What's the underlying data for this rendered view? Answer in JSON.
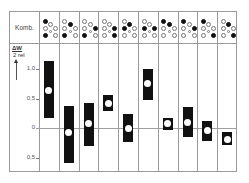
{
  "chart_data": {
    "type": "bar",
    "subtype": "floating-range-with-mean",
    "header_label": "Komb.",
    "ylabel": "ΔW/2 rel",
    "ylabel_parts": {
      "main": "ΔW",
      "sub": "2 rel"
    },
    "yticks": [
      {
        "value": 1.0,
        "label": "1,0"
      },
      {
        "value": 0.5,
        "label": "0,5"
      },
      {
        "value": 0,
        "label": "0"
      },
      {
        "value": -0.5,
        "label": "0,5"
      }
    ],
    "ylim": [
      -0.75,
      1.2
    ],
    "grid": false,
    "legend": null,
    "categories": [
      "K1",
      "K2",
      "K3",
      "K4",
      "K5",
      "K6",
      "K7",
      "K8",
      "K9",
      "K10"
    ],
    "combination_dot_positions": [
      "left-top",
      "left-mid",
      "left-bottom",
      "center-upper",
      "center-lower",
      "right-mid",
      "right-bottom"
    ],
    "combinations": [
      [
        1,
        0,
        1,
        0,
        0,
        0,
        0
      ],
      [
        0,
        0,
        1,
        1,
        0,
        0,
        0
      ],
      [
        0,
        0,
        1,
        0,
        0,
        1,
        0
      ],
      [
        0,
        0,
        0,
        0,
        0,
        1,
        1
      ],
      [
        0,
        1,
        0,
        1,
        0,
        0,
        0
      ],
      [
        0,
        1,
        0,
        0,
        0,
        1,
        0
      ],
      [
        1,
        0,
        0,
        1,
        0,
        0,
        0
      ],
      [
        1,
        0,
        0,
        0,
        0,
        1,
        0
      ],
      [
        1,
        0,
        0,
        0,
        0,
        0,
        1
      ],
      [
        0,
        0,
        0,
        1,
        0,
        0,
        1
      ]
    ],
    "series": [
      {
        "name": "range_top",
        "values": [
          1.14,
          0.37,
          0.42,
          0.56,
          0.24,
          1.0,
          0.17,
          0.36,
          0.12,
          -0.07
        ]
      },
      {
        "name": "range_bottom",
        "values": [
          0.17,
          -0.59,
          -0.31,
          0.29,
          -0.24,
          0.47,
          -0.03,
          -0.15,
          -0.22,
          -0.29
        ]
      },
      {
        "name": "mean",
        "values": [
          0.64,
          -0.08,
          0.07,
          0.42,
          0.0,
          0.75,
          0.07,
          0.1,
          -0.05,
          -0.19
        ]
      }
    ]
  }
}
